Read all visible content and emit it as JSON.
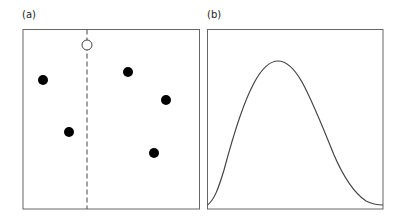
{
  "panels": [
    {
      "label": "(a)",
      "kind": "scatter",
      "box": {
        "x": 23,
        "y": 29,
        "w": 177,
        "h": 180
      },
      "dashed_line_x": 87,
      "open_point": {
        "x": 87,
        "y": 45
      },
      "filled_points": [
        {
          "x": 43,
          "y": 80
        },
        {
          "x": 69,
          "y": 132
        },
        {
          "x": 128,
          "y": 72
        },
        {
          "x": 166,
          "y": 100
        },
        {
          "x": 154,
          "y": 153
        }
      ]
    },
    {
      "label": "(b)",
      "kind": "bell-curve",
      "box": {
        "x": 207,
        "y": 29,
        "w": 176,
        "h": 180
      },
      "peak": {
        "x": 278,
        "y": 61
      }
    }
  ],
  "colors": {
    "stroke": "#555555",
    "point": "#000000",
    "background": "#ffffff"
  }
}
